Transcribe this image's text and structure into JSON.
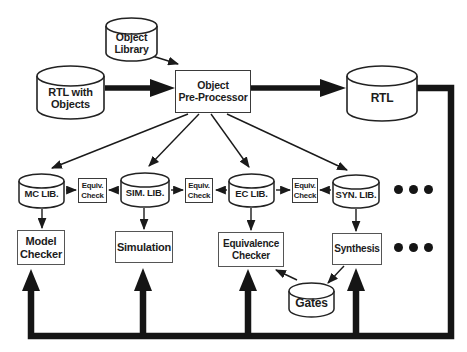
{
  "colors": {
    "ink": "#1a1a1a",
    "background": "#ffffff"
  },
  "nodes": {
    "object_library": "Object\nLibrary",
    "rtl_with_objects": "RTL with\nObjects",
    "object_pre_processor": "Object\nPre-Processor",
    "rtl": "RTL",
    "mc_lib": "MC LIB.",
    "sim_lib": "SIM. LIB.",
    "ec_lib": "EC LIB.",
    "syn_lib": "SYN. LIB.",
    "equiv_check": "Equiv.\nCheck",
    "model_checker": "Model\nChecker",
    "simulation": "Simulation",
    "equivalence_checker": "Equivalence\nChecker",
    "synthesis": "Synthesis",
    "gates": "Gates"
  },
  "icons": {
    "cylinder": "database-cylinder",
    "ellipsis_row_libs": "three-dots",
    "ellipsis_row_tools": "three-dots"
  },
  "edges": [
    {
      "from": "object_library",
      "to": "object_pre_processor",
      "style": "thin"
    },
    {
      "from": "rtl_with_objects",
      "to": "object_pre_processor",
      "style": "thick"
    },
    {
      "from": "object_pre_processor",
      "to": "rtl",
      "style": "thick"
    },
    {
      "from": "object_pre_processor",
      "to": "mc_lib",
      "style": "thin"
    },
    {
      "from": "object_pre_processor",
      "to": "sim_lib",
      "style": "thin"
    },
    {
      "from": "object_pre_processor",
      "to": "ec_lib",
      "style": "thin"
    },
    {
      "from": "object_pre_processor",
      "to": "syn_lib",
      "style": "thin"
    },
    {
      "from": "mc_lib",
      "to": "equiv_check_1",
      "style": "thin"
    },
    {
      "from": "sim_lib",
      "to": "equiv_check_1",
      "style": "thin"
    },
    {
      "from": "sim_lib",
      "to": "equiv_check_2",
      "style": "thin"
    },
    {
      "from": "ec_lib",
      "to": "equiv_check_2",
      "style": "thin"
    },
    {
      "from": "ec_lib",
      "to": "equiv_check_3",
      "style": "thin"
    },
    {
      "from": "syn_lib",
      "to": "equiv_check_3",
      "style": "thin"
    },
    {
      "from": "mc_lib",
      "to": "model_checker",
      "style": "thin"
    },
    {
      "from": "sim_lib",
      "to": "simulation",
      "style": "thin"
    },
    {
      "from": "ec_lib",
      "to": "equivalence_checker",
      "style": "thin"
    },
    {
      "from": "syn_lib",
      "to": "synthesis",
      "style": "thin"
    },
    {
      "from": "synthesis",
      "to": "gates",
      "style": "thin"
    },
    {
      "from": "gates",
      "to": "equivalence_checker",
      "style": "thin"
    },
    {
      "from": "rtl",
      "to": "model_checker",
      "style": "thick-feedback"
    },
    {
      "from": "rtl",
      "to": "simulation",
      "style": "thick-feedback"
    },
    {
      "from": "rtl",
      "to": "equivalence_checker",
      "style": "thick-feedback"
    },
    {
      "from": "rtl",
      "to": "synthesis",
      "style": "thick-feedback"
    }
  ]
}
